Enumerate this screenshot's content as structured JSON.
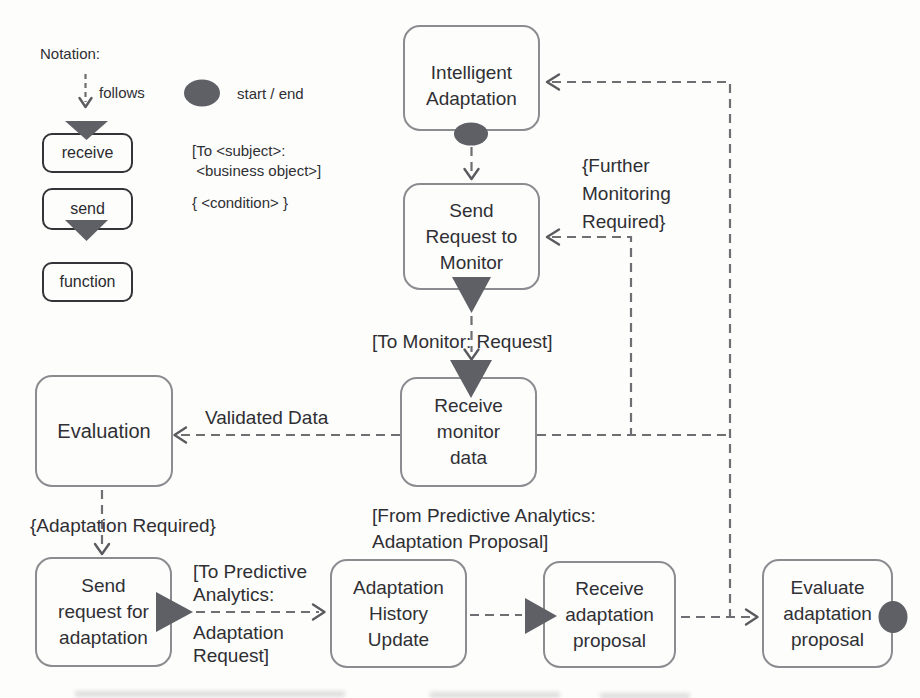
{
  "colors": {
    "shape_fill": "#5f6066",
    "dash_line": "#6e6e73",
    "node_border": "#8b8c90",
    "legend_border": "#333338",
    "text": "#303034"
  },
  "notation": {
    "title": "Notation:",
    "follows_label": "follows",
    "start_end_label": "start / end",
    "receive_label": "receive",
    "send_label": "send",
    "function_label": "function",
    "message_syntax": "[To <subject>:\n <business object>]",
    "condition_syntax": "{ <condition> }"
  },
  "nodes": {
    "intelligent_adaptation": "Intelligent\nAdaptation",
    "send_request_to_monitor": "Send\nRequest to\nMonitor",
    "receive_monitor_data": "Receive\nmonitor\ndata",
    "evaluation": "Evaluation",
    "send_request_for_adaptation": "Send\nrequest for\nadaptation",
    "adaptation_history_update": "Adaptation\nHistory\nUpdate",
    "receive_adaptation_proposal": "Receive\nadaptation\nproposal",
    "evaluate_adaptation_proposal": "Evaluate\nadaptation\nproposal"
  },
  "edge_labels": {
    "to_monitor_request": "[To Monitor: Request]",
    "validated_data": "Validated Data",
    "further_monitoring_required": "{Further\nMonitoring\nRequired}",
    "adaptation_required": "{Adaptation Required}",
    "to_predictive_analytics_top": "[To Predictive\nAnalytics:",
    "to_predictive_analytics_bottom": "Adaptation\nRequest]",
    "from_predictive_analytics": "[From Predictive Analytics:\nAdaptation Proposal]"
  }
}
